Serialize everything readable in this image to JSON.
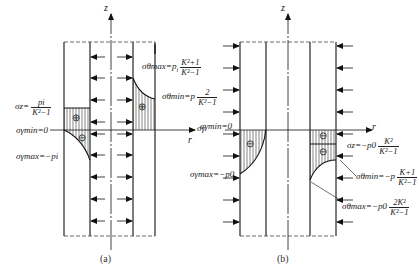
{
  "figure_a": {
    "caption": "(a)",
    "axis_z": "z",
    "axis_r": "r",
    "labels": {
      "sigma_theta_max": {
        "lhs": "σθmax=p",
        "sub": "i",
        "num": "K²+1",
        "den": "K²−1"
      },
      "sigma_theta_min": {
        "lhs": "σθmin=p",
        "sub": "i",
        "num": "2",
        "den": "K²−1"
      },
      "sigma_z": {
        "lhs": "σz=",
        "num": "pi",
        "den": "K²−1"
      },
      "sigma_r_min": "σγmin=0",
      "sigma_r_max": "σγmax=−pi",
      "sign_plus_1": "⊕",
      "sign_plus_2": "⊕",
      "sign_minus": "⊖",
      "r_side_label": "σγ"
    }
  },
  "figure_b": {
    "caption": "(b)",
    "axis_z": "z",
    "axis_r": "r",
    "labels": {
      "sigma_r_min": "σγmin=0",
      "sigma_r_max": "σγmax=−p0",
      "sigma_z": {
        "lhs": "σz=−p0",
        "num": "K²",
        "den": "K²−1"
      },
      "sigma_theta_min": {
        "lhs": "σθmin=−p",
        "num": "K+1",
        "den": "K²−1"
      },
      "sigma_theta_max": {
        "lhs": "σθmax=−p0",
        "num": "2K²",
        "den": "K²−1"
      },
      "sign_minus_1": "⊖",
      "sign_minus_2": "⊖",
      "sign_minus_3": "⊖"
    }
  }
}
